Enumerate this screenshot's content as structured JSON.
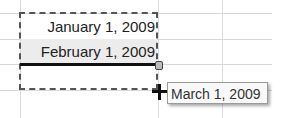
{
  "cells": [
    {
      "value": "January 1, 2009"
    },
    {
      "value": "February 1, 2009"
    },
    {
      "value": ""
    }
  ],
  "autofill_tooltip": "March 1, 2009",
  "cursor": "fill-crosshair"
}
